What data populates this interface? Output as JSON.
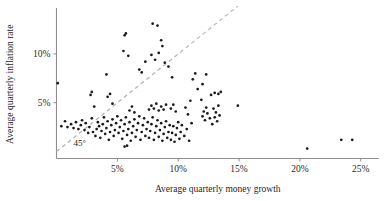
{
  "chart_data": {
    "type": "scatter",
    "title": "",
    "xlabel": "Average quarterly money growth",
    "ylabel": "Average quarterly inflation rate",
    "xlim": [
      0,
      26.5
    ],
    "ylim": [
      0,
      14.5
    ],
    "grid": false,
    "legend": null,
    "xticks": [
      {
        "value": 5,
        "label": "5%"
      },
      {
        "value": 10,
        "label": "10%"
      },
      {
        "value": 15,
        "label": "15%"
      },
      {
        "value": 20,
        "label": "20%"
      },
      {
        "value": 25,
        "label": "25%"
      }
    ],
    "yticks": [
      {
        "value": 5,
        "label": "5%"
      },
      {
        "value": 10,
        "label": "10%"
      }
    ],
    "annotations": [
      {
        "text": "45°",
        "x": 1.4,
        "y": 0.55,
        "kind": "reference-line-label"
      }
    ],
    "reference_line": {
      "label": "45°",
      "kind": "dashed",
      "slope": 1,
      "intercept": 0,
      "color": "#b3b3b3",
      "x_start": 0.0,
      "x_end": 14.9
    },
    "series": [
      {
        "name": "countries",
        "marker": "dot",
        "color": "#1b1b1b",
        "points": [
          [
            0.1,
            7.0
          ],
          [
            0.4,
            2.6
          ],
          [
            0.7,
            3.1
          ],
          [
            0.9,
            2.5
          ],
          [
            1.2,
            2.8
          ],
          [
            1.4,
            2.4
          ],
          [
            1.6,
            3.0
          ],
          [
            1.8,
            2.3
          ],
          [
            2.0,
            2.7
          ],
          [
            2.1,
            3.2
          ],
          [
            2.3,
            2.2
          ],
          [
            2.4,
            2.9
          ],
          [
            2.6,
            1.9
          ],
          [
            2.7,
            2.5
          ],
          [
            2.9,
            3.4
          ],
          [
            3.0,
            2.0
          ],
          [
            2.8,
            5.8
          ],
          [
            2.9,
            6.1
          ],
          [
            3.1,
            4.6
          ],
          [
            3.2,
            1.6
          ],
          [
            3.3,
            2.3
          ],
          [
            3.4,
            3.0
          ],
          [
            3.5,
            2.6
          ],
          [
            3.6,
            1.4
          ],
          [
            3.7,
            2.1
          ],
          [
            3.8,
            2.8
          ],
          [
            3.9,
            3.5
          ],
          [
            4.0,
            1.8
          ],
          [
            4.1,
            2.4
          ],
          [
            4.2,
            3.1
          ],
          [
            4.3,
            1.2
          ],
          [
            4.4,
            2.0
          ],
          [
            4.5,
            2.7
          ],
          [
            4.6,
            3.3
          ],
          [
            4.7,
            1.6
          ],
          [
            4.8,
            2.2
          ],
          [
            4.9,
            2.9
          ],
          [
            5.0,
            3.6
          ],
          [
            5.1,
            1.9
          ],
          [
            5.2,
            2.5
          ],
          [
            5.3,
            3.2
          ],
          [
            4.2,
            5.6
          ],
          [
            4.4,
            5.9
          ],
          [
            4.6,
            4.9
          ],
          [
            4.1,
            7.9
          ],
          [
            5.4,
            1.3
          ],
          [
            5.5,
            2.1
          ],
          [
            5.6,
            2.8
          ],
          [
            5.7,
            3.5
          ],
          [
            5.8,
            1.7
          ],
          [
            5.9,
            2.3
          ],
          [
            6.0,
            3.0
          ],
          [
            6.1,
            1.1
          ],
          [
            6.2,
            1.9
          ],
          [
            6.3,
            2.6
          ],
          [
            6.4,
            3.3
          ],
          [
            6.5,
            1.5
          ],
          [
            6.6,
            2.2
          ],
          [
            6.7,
            2.9
          ],
          [
            6.8,
            3.6
          ],
          [
            6.9,
            1.2
          ],
          [
            7.0,
            2.0
          ],
          [
            7.1,
            2.7
          ],
          [
            7.2,
            3.4
          ],
          [
            7.3,
            1.6
          ],
          [
            5.6,
            0.5
          ],
          [
            5.8,
            0.6
          ],
          [
            6.0,
            4.2
          ],
          [
            6.2,
            4.6
          ],
          [
            6.4,
            4.0
          ],
          [
            5.5,
            10.3
          ],
          [
            5.6,
            11.9
          ],
          [
            5.7,
            12.1
          ],
          [
            5.9,
            9.8
          ],
          [
            6.8,
            8.4
          ],
          [
            7.0,
            8.1
          ],
          [
            7.3,
            9.2
          ],
          [
            7.4,
            2.3
          ],
          [
            7.5,
            3.0
          ],
          [
            7.6,
            1.4
          ],
          [
            7.7,
            2.1
          ],
          [
            7.8,
            2.8
          ],
          [
            7.9,
            3.5
          ],
          [
            8.0,
            1.2
          ],
          [
            8.1,
            1.9
          ],
          [
            8.2,
            2.6
          ],
          [
            8.3,
            3.2
          ],
          [
            8.4,
            1.5
          ],
          [
            8.5,
            2.2
          ],
          [
            8.6,
            2.9
          ],
          [
            8.7,
            1.1
          ],
          [
            8.8,
            1.8
          ],
          [
            8.9,
            2.5
          ],
          [
            9.0,
            3.1
          ],
          [
            9.1,
            1.4
          ],
          [
            9.2,
            2.0
          ],
          [
            9.3,
            2.7
          ],
          [
            7.6,
            4.3
          ],
          [
            7.8,
            4.7
          ],
          [
            8.0,
            4.4
          ],
          [
            8.2,
            4.9
          ],
          [
            8.4,
            4.2
          ],
          [
            8.6,
            4.6
          ],
          [
            8.8,
            4.3
          ],
          [
            9.0,
            4.8
          ],
          [
            7.9,
            13.1
          ],
          [
            8.3,
            12.9
          ],
          [
            8.6,
            11.4
          ],
          [
            8.7,
            10.8
          ],
          [
            7.8,
            9.9
          ],
          [
            8.1,
            9.4
          ],
          [
            8.4,
            10.1
          ],
          [
            8.9,
            9.1
          ],
          [
            9.4,
            1.2
          ],
          [
            9.5,
            1.9
          ],
          [
            9.6,
            2.6
          ],
          [
            9.7,
            1.0
          ],
          [
            9.8,
            1.7
          ],
          [
            9.9,
            2.4
          ],
          [
            10.0,
            3.0
          ],
          [
            10.1,
            1.3
          ],
          [
            10.2,
            2.0
          ],
          [
            10.3,
            2.7
          ],
          [
            9.4,
            4.4
          ],
          [
            9.6,
            4.8
          ],
          [
            9.8,
            4.1
          ],
          [
            9.2,
            8.7
          ],
          [
            9.5,
            7.6
          ],
          [
            10.5,
            1.6
          ],
          [
            10.7,
            2.3
          ],
          [
            10.9,
            1.1
          ],
          [
            11.1,
            2.9
          ],
          [
            10.6,
            4.5
          ],
          [
            10.8,
            3.8
          ],
          [
            11.0,
            5.2
          ],
          [
            11.2,
            7.4
          ],
          [
            11.4,
            8.0
          ],
          [
            11.6,
            6.4
          ],
          [
            11.9,
            5.3
          ],
          [
            12.0,
            3.6
          ],
          [
            12.2,
            3.2
          ],
          [
            12.4,
            3.9
          ],
          [
            12.6,
            3.4
          ],
          [
            12.1,
            4.1
          ],
          [
            12.3,
            4.5
          ],
          [
            12.0,
            6.9
          ],
          [
            12.3,
            7.9
          ],
          [
            12.8,
            2.8
          ],
          [
            13.0,
            3.5
          ],
          [
            13.2,
            3.1
          ],
          [
            13.4,
            3.7
          ],
          [
            12.9,
            4.4
          ],
          [
            13.1,
            4.0
          ],
          [
            13.3,
            4.7
          ],
          [
            12.7,
            5.8
          ],
          [
            13.0,
            6.0
          ],
          [
            13.3,
            5.9
          ],
          [
            13.5,
            6.1
          ],
          [
            14.9,
            4.7
          ],
          [
            20.6,
            0.3
          ],
          [
            23.4,
            1.2
          ],
          [
            24.3,
            1.2
          ]
        ]
      }
    ]
  }
}
